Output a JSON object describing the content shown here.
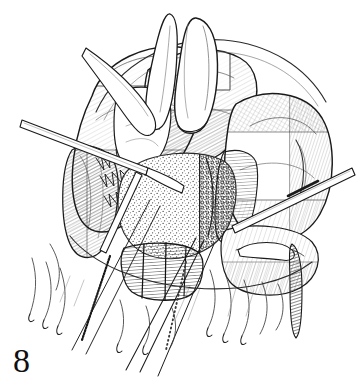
{
  "figure": {
    "number": "8",
    "caption": "",
    "medium": "pen-and-ink line drawing",
    "background_color": "#ffffff",
    "ink_color": "#1a1a1a"
  },
  "canvas": {
    "width": 363,
    "height": 390
  },
  "palette": {
    "ink": "#1a1a1a",
    "ink_mid": "#3a3a3a",
    "ink_light": "#6e6e6e",
    "ink_faint": "#9a9a9a",
    "paper": "#ffffff"
  },
  "elements": [
    {
      "name": "upper-left-tissue-lobe",
      "label": "Upper left rounded tissue lobe with fine parallel hatching"
    },
    {
      "name": "upper-center-tissue-lobe",
      "label": "Upper center tissue lobe under retractor"
    },
    {
      "name": "upper-right-tissue-lobe",
      "label": "Large right-side tissue lobe with cross hatching"
    },
    {
      "name": "central-stippled-tissue",
      "label": "Central stippled fatty tissue mass"
    },
    {
      "name": "lower-hatched-flap",
      "label": "Lower vertically hatched tissue flap"
    },
    {
      "name": "curved-retractor-instrument",
      "label": "Curved hook retractor at top center"
    },
    {
      "name": "thin-probe-instrument",
      "label": "Thin curved probe entering from upper left"
    },
    {
      "name": "straight-probe-instrument",
      "label": "Straight slender instrument crossing from left"
    },
    {
      "name": "right-instrument-shaft",
      "label": "Banded instrument shaft entering from right"
    },
    {
      "name": "right-instrument-tip",
      "label": "Tapered instrument tip at lower right"
    },
    {
      "name": "suture-threads",
      "label": "Diagonal suture threads descending to lower left"
    },
    {
      "name": "braided-suture-thread",
      "label": "Braided textured suture thread"
    },
    {
      "name": "dotted-suture-thread",
      "label": "Dotted suture thread"
    },
    {
      "name": "tissue-fringe-strands",
      "label": "Hanging tissue strands along lower margin"
    }
  ]
}
